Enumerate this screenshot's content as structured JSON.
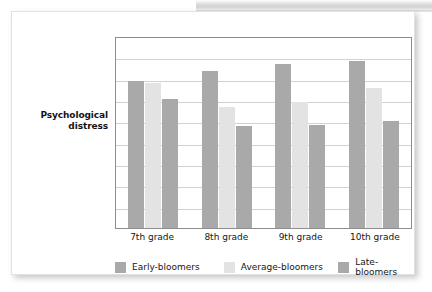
{
  "figure": {
    "axis_caption_line1": "Psychological",
    "axis_caption_line2": "distress"
  },
  "chart_data": {
    "type": "bar",
    "title": "",
    "xlabel": "",
    "ylabel": "Psychological distress",
    "categories": [
      "7th grade",
      "8th grade",
      "9th grade",
      "10th grade"
    ],
    "series": [
      {
        "name": "Early-bloomers",
        "color": "#a9a9a9",
        "values": [
          0.765,
          0.82,
          0.855,
          0.87
        ]
      },
      {
        "name": "Average-bloomers",
        "color": "#e3e3e3",
        "values": [
          0.755,
          0.63,
          0.656,
          0.73
        ]
      },
      {
        "name": "Late-bloomers",
        "color": "#a9a9a9",
        "values": [
          0.67,
          0.53,
          0.536,
          0.557
        ]
      }
    ],
    "ylim": [
      0,
      1
    ],
    "y_tick_labels": [],
    "gridlines": 8,
    "grid": true,
    "legend_position": "bottom"
  }
}
